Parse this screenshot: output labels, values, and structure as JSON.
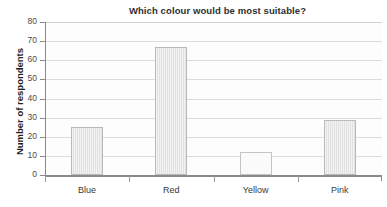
{
  "chart_data": {
    "type": "bar",
    "title": "Which colour would be most suitable?",
    "xlabel": "",
    "ylabel": "Number of respondents",
    "categories": [
      "Blue",
      "Red",
      "Yellow",
      "Pink"
    ],
    "values": [
      25,
      67,
      12,
      29
    ],
    "series": [
      {
        "name": "Number of respondents",
        "values": [
          25,
          67,
          12,
          29
        ]
      }
    ],
    "ylim": [
      0,
      80
    ],
    "ytick_step": 10,
    "ytick_labels": [
      "80",
      "70",
      "60",
      "50",
      "40",
      "30",
      "20",
      "10",
      "0"
    ],
    "grid": true,
    "legend": false,
    "legend_position": "none",
    "colors": {
      "bar_fill": "#e4e4e4",
      "bar_fill_pale": "#fbfbfb",
      "bar_border": "#b9b9b9",
      "gridline": "#d2d2d2",
      "axis_line": "#8a8a8a",
      "title_text": "#2f2f2f",
      "tick_text": "#4a4a4a",
      "plot_background": "#fdfdfd",
      "page_background": "#ffffff"
    }
  }
}
